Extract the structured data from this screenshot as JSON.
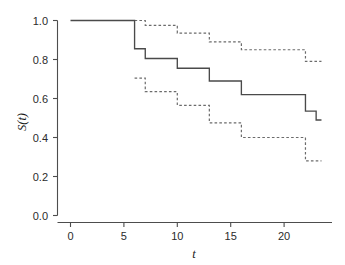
{
  "chart_data": {
    "type": "line",
    "title": "",
    "subtitle": "",
    "xlabel": "t",
    "ylabel": "S(t)",
    "xlim": [
      -0.4,
      24.2
    ],
    "ylim": [
      -0.03,
      1.05
    ],
    "xticks": [
      0,
      5,
      10,
      15,
      20
    ],
    "xticklabels": [
      "0",
      "5",
      "10",
      "15",
      "20"
    ],
    "yticks": [
      0.0,
      0.2,
      0.4,
      0.6,
      0.8,
      1.0
    ],
    "yticklabels": [
      "0.0",
      "0.2",
      "0.4",
      "0.6",
      "0.8",
      "1.0"
    ],
    "grid": false,
    "legend": "none",
    "step_style": "post",
    "series": [
      {
        "name": "Kaplan-Meier estimate",
        "style": "solid",
        "color": "#4a4a4a",
        "x": [
          0,
          6,
          7,
          10,
          13,
          16,
          22,
          23,
          23.5
        ],
        "values": [
          1.0,
          0.855,
          0.805,
          0.755,
          0.69,
          0.62,
          0.535,
          0.49,
          0.49
        ]
      },
      {
        "name": "Upper 95% confidence limit",
        "style": "dashed",
        "color": "#6b6b6b",
        "x": [
          6,
          7,
          10,
          13,
          16,
          22,
          23.5
        ],
        "values": [
          1.0,
          0.975,
          0.935,
          0.89,
          0.85,
          0.79,
          0.79
        ]
      },
      {
        "name": "Lower 95% confidence limit",
        "style": "dashed",
        "color": "#6b6b6b",
        "x": [
          6,
          7,
          10,
          13,
          16,
          22,
          23.5
        ],
        "values": [
          0.705,
          0.635,
          0.565,
          0.475,
          0.4,
          0.28,
          0.28
        ]
      }
    ]
  },
  "axes": {
    "y_label_text": "S(t)",
    "x_label_text": "t"
  }
}
